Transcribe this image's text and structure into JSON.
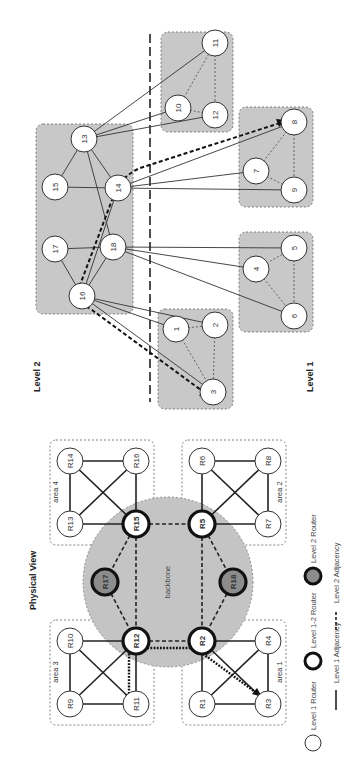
{
  "physical_view": {
    "title": "Physical View",
    "backbone_label": "backbone",
    "areas": [
      {
        "id": "area1",
        "label": "area 1",
        "routers": [
          "R1",
          "R2",
          "R3",
          "R4"
        ]
      },
      {
        "id": "area2",
        "label": "area 2",
        "routers": [
          "R5",
          "R6",
          "R7",
          "R8"
        ]
      },
      {
        "id": "area3",
        "label": "area 3",
        "routers": [
          "R9",
          "R10",
          "R11",
          "R12"
        ]
      },
      {
        "id": "area4",
        "label": "area 4",
        "routers": [
          "R13",
          "R14",
          "R15",
          "R16"
        ]
      }
    ],
    "routers": {
      "R1": "R1",
      "R2": "R2",
      "R3": "R3",
      "R4": "R4",
      "R5": "R5",
      "R6": "R6",
      "R7": "R7",
      "R8": "R8",
      "R9": "R9",
      "R10": "R10",
      "R11": "R11",
      "R12": "R12",
      "R13": "R13",
      "R14": "R14",
      "R15": "R15",
      "R16": "R16",
      "R17": "R17",
      "R18": "R18"
    },
    "level1_2_routers": [
      "R2",
      "R5",
      "R12",
      "R15"
    ],
    "level2_routers": [
      "R17",
      "R18"
    ]
  },
  "logical_view": {
    "level2_label": "Level 2",
    "level1_label": "Level 1",
    "level2_nodes": {
      "n13": "13",
      "n14": "14",
      "n15": "15",
      "n16": "16",
      "n17": "17",
      "n18": "18"
    },
    "level1_nodes": {
      "n1": "1",
      "n2": "2",
      "n3": "3",
      "n4": "4",
      "n5": "5",
      "n6": "6",
      "n7": "7",
      "n8": "8",
      "n9": "9",
      "n10": "10",
      "n11": "11",
      "n12": "12"
    }
  },
  "legend": {
    "level1_router": "Level 1 Router",
    "level12_router": "Level 1-2 Router",
    "level2_router": "Level 2 Router",
    "level1_adjacency": "Level 1 Adjacency",
    "level2_adjacency": "Level 2 Adjacency"
  },
  "colors": {
    "area_fill": "#c8c8c8",
    "backbone_fill": "#c4c4c4",
    "level2_router_fill": "#8c8c8c",
    "line": "#222222"
  }
}
